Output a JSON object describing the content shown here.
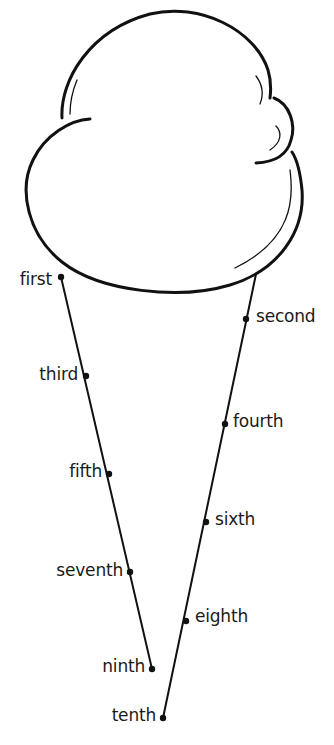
{
  "figure": {
    "type": "ice-cream-cone-ordinal-worksheet",
    "stroke_color": "#111111",
    "background": "#ffffff"
  },
  "ordinals": [
    {
      "label": "first",
      "side": "left",
      "dot": [
        61,
        277
      ],
      "text_x": 52,
      "text_y": 271
    },
    {
      "label": "second",
      "side": "right",
      "dot": [
        246,
        319
      ],
      "text_x": 256,
      "text_y": 306
    },
    {
      "label": "third",
      "side": "left",
      "dot": [
        86,
        376
      ],
      "text_x": 78,
      "text_y": 364
    },
    {
      "label": "fourth",
      "side": "right",
      "dot": [
        225,
        424
      ],
      "text_x": 233,
      "text_y": 411
    },
    {
      "label": "fifth",
      "side": "left",
      "dot": [
        109,
        474
      ],
      "text_x": 101,
      "text_y": 461
    },
    {
      "label": "sixth",
      "side": "right",
      "dot": [
        206,
        522
      ],
      "text_x": 215,
      "text_y": 509
    },
    {
      "label": "seventh",
      "side": "left",
      "dot": [
        130,
        572
      ],
      "text_x": 122,
      "text_y": 560
    },
    {
      "label": "eighth",
      "side": "right",
      "dot": [
        186,
        621
      ],
      "text_x": 195,
      "text_y": 608
    },
    {
      "label": "ninth",
      "side": "left",
      "dot": [
        152,
        669
      ],
      "text_x": 144,
      "text_y": 656
    },
    {
      "label": "tenth",
      "side": "left",
      "dot": [
        163,
        718
      ],
      "text_x": 155,
      "text_y": 705
    }
  ]
}
